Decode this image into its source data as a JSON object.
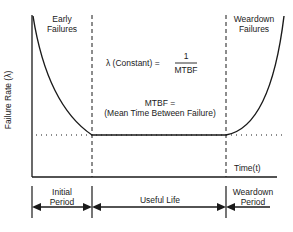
{
  "diagram": {
    "y_axis_label": "Failure Rate (λ)",
    "x_axis_label": "Time(t)",
    "regions": {
      "early": {
        "line1": "Early",
        "line2": "Failures"
      },
      "weardown": {
        "line1": "Weardown",
        "line2": "Failures"
      }
    },
    "formula": {
      "lhs": "λ (Constant) =",
      "numerator": "1",
      "denominator": "MTBF"
    },
    "mtbf": {
      "line1": "MTBF =",
      "line2": "(Mean Time Between Failure)"
    },
    "periods": [
      {
        "line1": "Initial",
        "line2": "Period"
      },
      {
        "line1": "Useful Life",
        "line2": ""
      },
      {
        "line1": "Weardown",
        "line2": "Period"
      }
    ],
    "colors": {
      "ink": "#1a1a1a",
      "background": "#ffffff"
    }
  }
}
